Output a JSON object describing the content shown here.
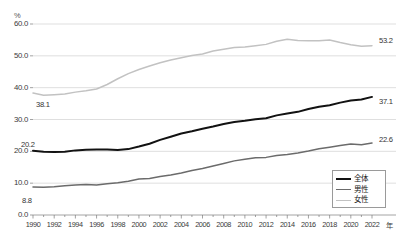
{
  "chart": {
    "title": "",
    "unit_label": "%",
    "x_unit_suffix": "年"
  },
  "legend": {
    "position": "bottom-right",
    "items": [
      {
        "label": "全体",
        "color": "#121212",
        "width": 2.0
      },
      {
        "label": "男性",
        "color": "#6b6b6b",
        "width": 1.6
      },
      {
        "label": "女性",
        "color": "#c2c2c2",
        "width": 1.6
      }
    ]
  },
  "annotations": [
    {
      "name": "female-start-value",
      "text": "38.1",
      "x": 36,
      "y": 100,
      "muted": false
    },
    {
      "name": "total-start-value",
      "text": "20.2",
      "x": 21,
      "y": 140,
      "muted": false
    },
    {
      "name": "male-start-value",
      "text": "8.8",
      "x": 22,
      "y": 196,
      "muted": false
    },
    {
      "name": "female-end-value",
      "text": "53.2",
      "x": 379,
      "y": 36,
      "muted": false
    },
    {
      "name": "total-end-value",
      "text": "37.1",
      "x": 379,
      "y": 97,
      "muted": false
    },
    {
      "name": "male-end-value",
      "text": "22.6",
      "x": 379,
      "y": 135,
      "muted": false
    }
  ],
  "chart_data": {
    "type": "line",
    "title": "",
    "xlabel": "年",
    "ylabel": "%",
    "xlim": [
      1990,
      2022
    ],
    "ylim": [
      0,
      60
    ],
    "ytick_step": 10,
    "yticks": [
      "0.0",
      "10.0",
      "20.0",
      "30.0",
      "40.0",
      "50.0",
      "60.0"
    ],
    "xticks": [
      1990,
      1992,
      1994,
      1996,
      1998,
      2000,
      2002,
      2004,
      2006,
      2008,
      2010,
      2012,
      2014,
      2016,
      2018,
      2020,
      2022
    ],
    "grid": true,
    "grid_axis": "y",
    "legend_position": "lower right",
    "x": [
      1990,
      1991,
      1992,
      1993,
      1994,
      1995,
      1996,
      1997,
      1998,
      1999,
      2000,
      2001,
      2002,
      2003,
      2004,
      2005,
      2006,
      2007,
      2008,
      2009,
      2010,
      2011,
      2012,
      2013,
      2014,
      2015,
      2016,
      2017,
      2018,
      2019,
      2020,
      2021,
      2022
    ],
    "series": [
      {
        "name": "全体",
        "color": "#121212",
        "values": [
          20.2,
          19.9,
          19.8,
          19.9,
          20.3,
          20.5,
          20.6,
          20.6,
          20.4,
          20.7,
          21.5,
          22.4,
          23.6,
          24.6,
          25.6,
          26.3,
          27.1,
          27.8,
          28.6,
          29.2,
          29.6,
          30.1,
          30.4,
          31.3,
          31.9,
          32.4,
          33.3,
          34.0,
          34.5,
          35.3,
          36.0,
          36.3,
          37.1
        ]
      },
      {
        "name": "男性",
        "color": "#6b6b6b",
        "values": [
          8.8,
          8.7,
          8.9,
          9.2,
          9.4,
          9.6,
          9.4,
          9.8,
          10.1,
          10.6,
          11.3,
          11.5,
          12.1,
          12.6,
          13.2,
          14.0,
          14.6,
          15.4,
          16.2,
          17.0,
          17.5,
          18.0,
          18.1,
          18.7,
          19.0,
          19.5,
          20.1,
          20.8,
          21.3,
          21.8,
          22.3,
          22.1,
          22.6
        ]
      },
      {
        "name": "女性",
        "color": "#c2c2c2",
        "values": [
          38.3,
          37.6,
          37.8,
          38.0,
          38.6,
          39.0,
          39.6,
          41.0,
          42.8,
          44.4,
          45.7,
          46.8,
          47.8,
          48.7,
          49.4,
          50.1,
          50.6,
          51.5,
          52.1,
          52.6,
          52.8,
          53.2,
          53.6,
          54.6,
          55.2,
          54.8,
          54.7,
          54.7,
          55.0,
          54.2,
          53.5,
          53.0,
          53.2
        ]
      }
    ]
  }
}
